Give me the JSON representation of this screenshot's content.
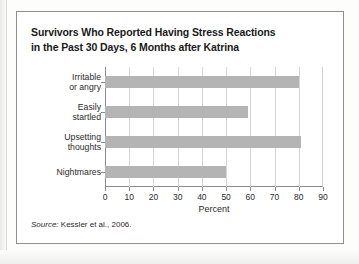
{
  "figure": {
    "title_line1": "Survivors Who Reported Having Stress Reactions",
    "title_line2": "in the Past 30 Days, 6 Months after Katrina",
    "source_prefix": "Source:",
    "source_text": "Kessler et al., 2006.",
    "border_color": "#8f8f8f",
    "bar_color": "#b4b4b4",
    "axis_color": "#8a8a8a",
    "grid_color": "#d5d5d5"
  },
  "chart_data": {
    "type": "bar",
    "orientation": "horizontal",
    "title": "Survivors Who Reported Having Stress Reactions in the Past 30 Days, 6 Months after Katrina",
    "categories": [
      "Irritable or angry",
      "Easily startled",
      "Upsetting thoughts",
      "Nightmares"
    ],
    "category_lines": [
      [
        "Irritable",
        "or angry"
      ],
      [
        "Easily",
        "startled"
      ],
      [
        "Upsetting",
        "thoughts"
      ],
      [
        "Nightmares"
      ]
    ],
    "values": [
      80,
      59,
      81,
      50
    ],
    "series": [
      {
        "name": "Percent reporting",
        "values": [
          80,
          59,
          81,
          50
        ]
      }
    ],
    "xlabel": "Percent",
    "ylabel": "",
    "xlim": [
      0,
      90
    ],
    "xticks": [
      0,
      10,
      20,
      30,
      40,
      50,
      60,
      70,
      80,
      90
    ],
    "xtick_labels": [
      "0",
      "10",
      "20",
      "30",
      "40",
      "50",
      "60",
      "70",
      "80",
      "90"
    ],
    "grid": "vertical",
    "legend": "none",
    "annotations": [
      "Source: Kessler et al., 2006."
    ]
  }
}
